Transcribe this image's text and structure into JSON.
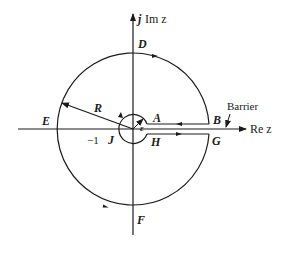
{
  "diagram": {
    "type": "contour-integration-keyhole",
    "axes": {
      "imag_label_j": "j",
      "imag_label_rest": "Im z",
      "real_label_rest": "Re z"
    },
    "points": {
      "A": "A",
      "B": "B",
      "D": "D",
      "E": "E",
      "F": "F",
      "G": "G",
      "H": "H",
      "J": "J"
    },
    "radius_label": "R",
    "epsilon_label": "ε",
    "tick_label": "−1",
    "barrier_label": "Barrier",
    "colors": {
      "stroke": "#1a1a1a",
      "background": "#ffffff"
    }
  }
}
